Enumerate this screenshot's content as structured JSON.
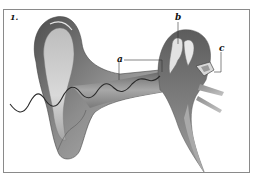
{
  "figure": {
    "number": "1.",
    "labels": {
      "a": "a",
      "b": "b",
      "c": "c"
    }
  },
  "colors": {
    "frame": "#8a8a8a",
    "tissue_dark": "#5a5a5a",
    "tissue_mid": "#9a9a9a",
    "tissue_light": "#d6d6d6",
    "wave": "#2a2a2a",
    "leader_line": "#333333"
  }
}
